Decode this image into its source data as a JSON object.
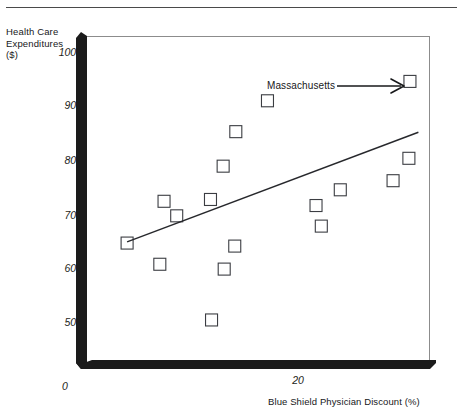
{
  "figure": {
    "has_top_rule": true,
    "background_color": "#ffffff",
    "axis_color": "#1b1b1b",
    "marker_color": "#3b3d42",
    "trendline_color": "#27282c"
  },
  "axes": {
    "y_title": "Health Care\nExpenditures\n($)",
    "x_title": "Blue Shield Physician Discount (%)",
    "y_ticks": [
      "1000",
      "900",
      "800",
      "700",
      "600",
      "500"
    ],
    "x_ticks": [
      "20"
    ],
    "origin_label": "0"
  },
  "annotations": [
    {
      "text": "Massachusetts",
      "target_point_index": 16,
      "arrow": "right-arrow"
    }
  ],
  "chart_data": {
    "type": "scatter",
    "title": "",
    "xlabel": "Blue Shield Physician Discount (%)",
    "ylabel": "Health Care Expenditures ($)",
    "xlim": [
      0,
      32.5
    ],
    "ylim": [
      460,
      1010
    ],
    "y_tick_values": [
      500,
      600,
      700,
      800,
      900,
      1000
    ],
    "x_tick_values": [
      20
    ],
    "grid": false,
    "legend": null,
    "marker_style": "open-square",
    "points": [
      {
        "x": 3.8,
        "y": 668,
        "label": ""
      },
      {
        "x": 7.3,
        "y": 737,
        "label": ""
      },
      {
        "x": 8.5,
        "y": 713,
        "label": ""
      },
      {
        "x": 6.9,
        "y": 633,
        "label": ""
      },
      {
        "x": 11.7,
        "y": 740,
        "label": ""
      },
      {
        "x": 12.9,
        "y": 795,
        "label": ""
      },
      {
        "x": 14.1,
        "y": 852,
        "label": ""
      },
      {
        "x": 13.0,
        "y": 625,
        "label": ""
      },
      {
        "x": 14.0,
        "y": 663,
        "label": ""
      },
      {
        "x": 11.8,
        "y": 541,
        "label": ""
      },
      {
        "x": 17.1,
        "y": 903,
        "label": ""
      },
      {
        "x": 21.7,
        "y": 730,
        "label": ""
      },
      {
        "x": 22.2,
        "y": 696,
        "label": ""
      },
      {
        "x": 24.0,
        "y": 756,
        "label": ""
      },
      {
        "x": 29.0,
        "y": 771,
        "label": ""
      },
      {
        "x": 30.5,
        "y": 808,
        "label": ""
      },
      {
        "x": 30.6,
        "y": 935,
        "label": "Massachusetts"
      }
    ],
    "trendline": {
      "type": "linear-fit",
      "x_start": 3.8,
      "y_start": 670,
      "x_end": 31.4,
      "y_end": 851
    }
  }
}
